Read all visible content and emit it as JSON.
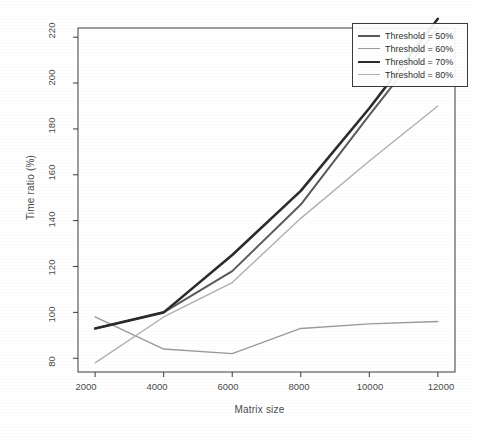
{
  "chart_data": {
    "type": "line",
    "title": "",
    "xlabel": "Matrix size",
    "ylabel": "Time ratio (%)",
    "x": [
      2000,
      4000,
      6000,
      8000,
      10000,
      12000
    ],
    "xticks": [
      "2000",
      "4000",
      "6000",
      "8000",
      "10000",
      "12000"
    ],
    "yticks": [
      "80",
      "100",
      "120",
      "140",
      "160",
      "180",
      "200",
      "220"
    ],
    "xlim": [
      1500,
      12500
    ],
    "ylim": [
      74,
      224
    ],
    "grid": false,
    "legend_position": "top-right",
    "series": [
      {
        "name": "Threshold = 50%",
        "label": "Threshold = 50%",
        "color": "#5a5a5a",
        "width": 2.0,
        "values": [
          93,
          100,
          118,
          147,
          186,
          224
        ]
      },
      {
        "name": "Threshold = 60%",
        "label": "Threshold = 60%",
        "color": "#9a9a9a",
        "width": 1.4,
        "values": [
          98,
          84,
          82,
          93,
          95,
          96
        ]
      },
      {
        "name": "Threshold = 70%",
        "label": "Threshold = 70%",
        "color": "#2b2b2b",
        "width": 2.6,
        "values": [
          93,
          100,
          125,
          153,
          189,
          228
        ]
      },
      {
        "name": "Threshold = 80%",
        "label": "Threshold = 80%",
        "color": "#b0b0b0",
        "width": 1.4,
        "values": [
          78,
          98,
          113,
          141,
          166,
          190
        ]
      }
    ]
  },
  "axes": {
    "frame_color": "#3a3a3a",
    "tick_color": "#3a3a3a"
  }
}
